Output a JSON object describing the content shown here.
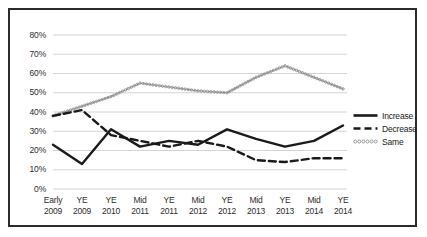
{
  "chart_data": {
    "type": "line",
    "title": "",
    "xlabel": "",
    "ylabel": "",
    "ylim": [
      0,
      0.8
    ],
    "ytick_labels": [
      "0%",
      "10%",
      "20%",
      "30%",
      "40%",
      "50%",
      "60%",
      "70%",
      "80%"
    ],
    "ytick_values": [
      0,
      10,
      20,
      30,
      40,
      50,
      60,
      70,
      80
    ],
    "grid": "horizontal",
    "legend_position": "right",
    "categories": [
      "Early 2009",
      "YE 2009",
      "YE 2010",
      "Mid 2011",
      "YE 2011",
      "Mid 2012",
      "YE 2012",
      "Mid 2013",
      "YE 2013",
      "Mid 2014",
      "YE 2014"
    ],
    "category_lines": [
      [
        "Early",
        "2009"
      ],
      [
        "YE",
        "2009"
      ],
      [
        "YE",
        "2010"
      ],
      [
        "Mid",
        "2011"
      ],
      [
        "YE",
        "2011"
      ],
      [
        "Mid",
        "2012"
      ],
      [
        "YE",
        "2012"
      ],
      [
        "Mid",
        "2013"
      ],
      [
        "YE",
        "2013"
      ],
      [
        "Mid",
        "2014"
      ],
      [
        "YE",
        "2014"
      ]
    ],
    "series": [
      {
        "name": "Increase",
        "style": "solid",
        "color": "#1a1a1a",
        "values": [
          23,
          13,
          31,
          22,
          25,
          23,
          31,
          26,
          22,
          25,
          33
        ]
      },
      {
        "name": "Decrease",
        "style": "dashed",
        "color": "#1a1a1a",
        "values": [
          38,
          41,
          28,
          25,
          22,
          25,
          22,
          15,
          14,
          16,
          16
        ]
      },
      {
        "name": "Same",
        "style": "dotted",
        "color": "#8a8a8a",
        "values": [
          38,
          43,
          48,
          55,
          53,
          51,
          50,
          58,
          64,
          58,
          52
        ]
      }
    ]
  },
  "legend": {
    "items": [
      {
        "label": "Increase"
      },
      {
        "label": "Decrease"
      },
      {
        "label": "Same"
      }
    ]
  },
  "colors": {
    "frame": "#2b2b2b",
    "grid": "#d4d4d4",
    "increase": "#1a1a1a",
    "decrease": "#1a1a1a",
    "same": "#8a8a8a",
    "background": "#ffffff"
  }
}
